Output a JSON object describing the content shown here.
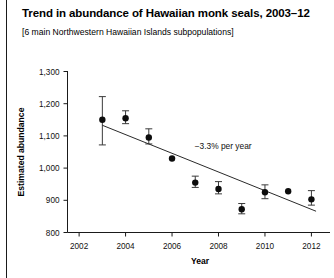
{
  "title": "Trend in abundance of Hawaiian monk seals, 2003–12",
  "subtitle": "[6 main Northwestern Hawaiian Islands subpopulations]",
  "annotation": "−3.3% per year",
  "axis": {
    "xlabel": "Year",
    "ylabel": "Estimated abundance"
  },
  "chart_data": {
    "type": "scatter",
    "title": "Trend in abundance of Hawaiian monk seals, 2003–12",
    "subtitle": "[6 main Northwestern Hawaiian Islands subpopulations]",
    "xlabel": "Year",
    "ylabel": "Estimated abundance",
    "xlim": [
      2001.5,
      2012.8
    ],
    "ylim": [
      800,
      1300
    ],
    "xticks": [
      2002,
      2004,
      2006,
      2008,
      2010,
      2012
    ],
    "xtick_labels": [
      "2002",
      "2004",
      "2006",
      "2008",
      "2010",
      "2012"
    ],
    "yticks": [
      800,
      900,
      1000,
      1100,
      1200,
      1300
    ],
    "ytick_labels": [
      "800",
      "900",
      "1,000",
      "1,100",
      "1,200",
      "1,300"
    ],
    "grid": false,
    "legend": null,
    "x": [
      2003,
      2004,
      2005,
      2006,
      2007,
      2008,
      2009,
      2010,
      2011,
      2012
    ],
    "values": [
      1150,
      1155,
      1095,
      1030,
      955,
      935,
      872,
      925,
      928,
      903
    ],
    "error_low": [
      1072,
      1138,
      1075,
      1030,
      940,
      920,
      858,
      905,
      928,
      885
    ],
    "error_high": [
      1222,
      1178,
      1122,
      1030,
      975,
      958,
      890,
      948,
      928,
      930
    ],
    "annotations": [
      {
        "text": "−3.3% per year",
        "x": 2008.2,
        "y": 1060
      }
    ],
    "trendline": {
      "type": "linear",
      "rate_percent_per_year": -3.3,
      "x": [
        2003,
        2012.2
      ],
      "y": [
        1133,
        866
      ]
    }
  }
}
